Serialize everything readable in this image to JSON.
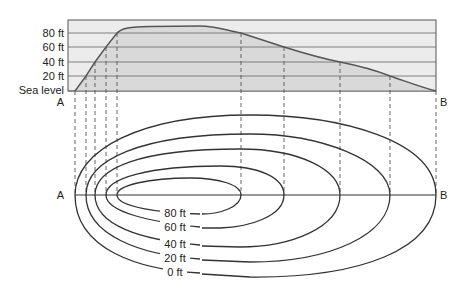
{
  "profile": {
    "elevation_labels": [
      "80 ft",
      "60 ft",
      "40 ft",
      "20 ft",
      "Sea level"
    ],
    "start_label": "A",
    "end_label": "B",
    "colors": {
      "box_fill": "#ececec",
      "area_fill": "#d9d9d9",
      "grid": "#555555",
      "curve": "#555555"
    }
  },
  "map": {
    "start_label": "A",
    "end_label": "B",
    "contour_labels": [
      "80 ft",
      "60 ft",
      "40 ft",
      "20 ft",
      "0 ft"
    ],
    "colors": {
      "contour": "#333333",
      "guide_dash": "#555555"
    }
  }
}
